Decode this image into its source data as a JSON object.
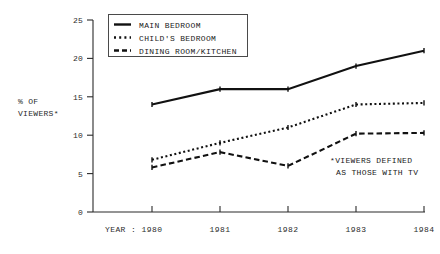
{
  "chart_data": {
    "type": "line",
    "title": "",
    "subtitle": "",
    "xlabel": "YEAR :",
    "ylabel": "% OF VIEWERS*",
    "ylabel_line1": "% OF",
    "ylabel_line2": "VIEWERS*",
    "categories": [
      "1980",
      "1981",
      "1982",
      "1983",
      "1984"
    ],
    "x": [
      1980,
      1981,
      1982,
      1983,
      1984
    ],
    "xlim": [
      1979.6,
      1984.4
    ],
    "ylim": [
      0,
      25
    ],
    "yticks": [
      "0",
      "5",
      "10",
      "15",
      "20",
      "25"
    ],
    "ytick_values": [
      0,
      5,
      10,
      15,
      20,
      25
    ],
    "grid": false,
    "legend_position": "top-center",
    "annotation": "*VIEWERS DEFINED AS THOSE WITH TV",
    "annotation_line1": "*VIEWERS DEFINED",
    "annotation_line2": "AS THOSE WITH TV",
    "series": [
      {
        "name": "MAIN BEDROOM",
        "style": "solid",
        "color": "#111111",
        "values": [
          14,
          16,
          16,
          19,
          21
        ]
      },
      {
        "name": "CHILD'S BEDROOM",
        "style": "dotted",
        "color": "#111111",
        "values": [
          6.8,
          9,
          11,
          14,
          14.2
        ]
      },
      {
        "name": "DINING ROOM/KITCHEN",
        "style": "dashed",
        "color": "#111111",
        "values": [
          5.8,
          7.8,
          6,
          10.2,
          10.3
        ]
      }
    ]
  },
  "legend": {
    "items": [
      {
        "label": "MAIN BEDROOM",
        "style": "solid"
      },
      {
        "label": "CHILD'S BEDROOM",
        "style": "dotted"
      },
      {
        "label": "DINING ROOM/KITCHEN",
        "style": "dashed"
      }
    ]
  },
  "axes": {
    "y_tick_0": "0",
    "y_tick_1": "5",
    "y_tick_2": "10",
    "y_tick_3": "15",
    "y_tick_4": "20",
    "y_tick_5": "25",
    "x_prefix": "YEAR :",
    "x_tick_0": "1980",
    "x_tick_1": "1981",
    "x_tick_2": "1982",
    "x_tick_3": "1983",
    "x_tick_4": "1984"
  },
  "colors": {
    "ink": "#111111",
    "axis": "#2b2b2b",
    "background": "#ffffff"
  }
}
